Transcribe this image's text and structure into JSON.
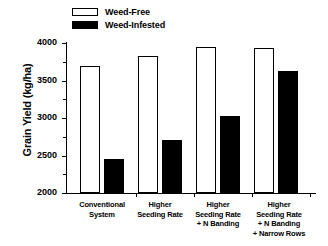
{
  "chart_data": {
    "type": "bar",
    "title": "",
    "xlabel": "",
    "ylabel": "Grain Yield (kg/ha)",
    "ylim": [
      2000,
      4000
    ],
    "yticks": [
      2000,
      2500,
      3000,
      3500,
      4000
    ],
    "ytick_labels": [
      "2000",
      "2500",
      "3000",
      "3500",
      "4000"
    ],
    "grid": false,
    "legend_position": "top-center",
    "categories": [
      "Conventional System",
      "Higher Seeding Rate",
      "Higher Seeding Rate + N Banding",
      "Higher Seeding Rate + N Banding + Narrow Rows"
    ],
    "category_label_lines": [
      [
        "Conventional",
        "System"
      ],
      [
        "Higher",
        "Seeding Rate"
      ],
      [
        "Higher",
        "Seeding Rate",
        "+ N Banding"
      ],
      [
        "Higher",
        "Seeding Rate",
        "+ N Banding",
        "+ Narrow Rows"
      ]
    ],
    "series": [
      {
        "name": "Weed-Free",
        "fill": "#ffffff",
        "edge": "#000000",
        "values": [
          3700,
          3825,
          3945,
          3940
        ]
      },
      {
        "name": "Weed-Infested",
        "fill": "#000000",
        "edge": "#000000",
        "values": [
          2450,
          2710,
          3030,
          3625
        ]
      }
    ]
  },
  "legend": {
    "items": [
      {
        "label": "Weed-Free",
        "swatch": "open-rect-icon"
      },
      {
        "label": "Weed-Infested",
        "swatch": "filled-rect-icon"
      }
    ]
  },
  "axes": {
    "y_title": "Grain Yield (kg/ha)",
    "y_tick_labels": [
      "4000",
      "3500",
      "3000",
      "2500",
      "2000"
    ]
  }
}
